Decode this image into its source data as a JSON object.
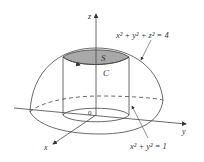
{
  "diagram": {
    "axes": {
      "x": "x",
      "y": "y",
      "z": "z",
      "origin": "0"
    },
    "surface_label": "S",
    "curve_label": "C",
    "sphere_equation": {
      "base": "x² + y² + z² = 4"
    },
    "cylinder_equation": {
      "base": "x² + y² = 1"
    },
    "colors": {
      "cap_fill": "#a9a9a9",
      "line": "#444444"
    }
  }
}
